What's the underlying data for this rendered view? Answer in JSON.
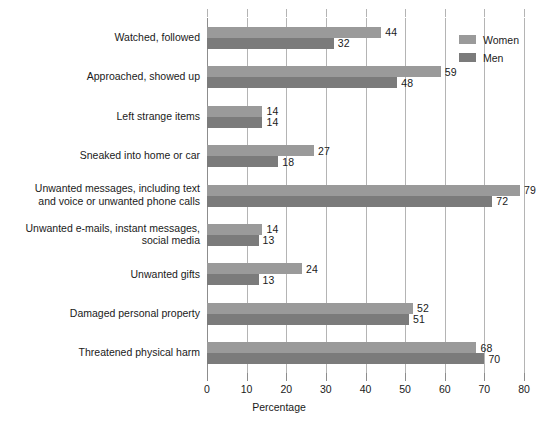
{
  "chart_data": {
    "type": "bar",
    "orientation": "horizontal",
    "title": "",
    "xlabel": "Percentage",
    "ylabel": "",
    "xlim": [
      0,
      80
    ],
    "xticks": [
      0,
      10,
      20,
      30,
      40,
      50,
      60,
      70,
      80
    ],
    "grid": "vertical",
    "legend_position": "top-right",
    "categories": [
      "Watched, followed",
      "Approached, showed up",
      "Left strange items",
      "Sneaked into home or car",
      "Unwanted messages, including text\nand voice or unwanted phone calls",
      "Unwanted e-mails, instant messages,\nsocial media",
      "Unwanted gifts",
      "Damaged personal property",
      "Threatened physical harm"
    ],
    "series": [
      {
        "name": "Women",
        "color": "#9a9a9a",
        "values": [
          44,
          59,
          14,
          27,
          79,
          14,
          24,
          52,
          68
        ]
      },
      {
        "name": "Men",
        "color": "#7b7b7b",
        "values": [
          32,
          48,
          14,
          18,
          72,
          13,
          13,
          51,
          70
        ]
      }
    ]
  },
  "axis": {
    "x_title": "Percentage",
    "tick_labels": [
      "0",
      "10",
      "20",
      "30",
      "40",
      "50",
      "60",
      "70",
      "80"
    ]
  },
  "legend": {
    "items": [
      {
        "label": "Women",
        "key": "women"
      },
      {
        "label": "Men",
        "key": "men"
      }
    ]
  }
}
